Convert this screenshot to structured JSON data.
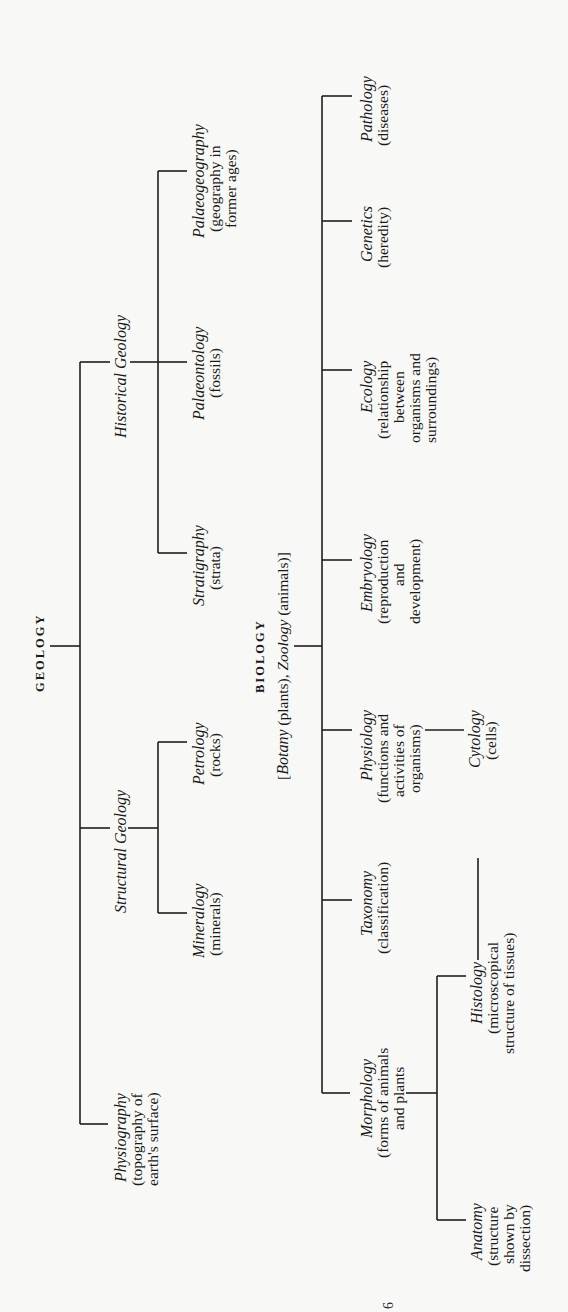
{
  "diagram": {
    "orientation": "rotated-90-ccw",
    "line_color": "#1e1e1e",
    "paper_color": "#f8f8f6",
    "geology": {
      "root": "GEOLOGY",
      "branches": [
        {
          "name": "Historical Geology",
          "children": [
            {
              "name": "Palaeogeography",
              "desc": [
                "(geography in",
                "former ages)"
              ]
            },
            {
              "name": "Palaeontology",
              "desc": [
                "(fossils)"
              ]
            },
            {
              "name": "Stratigraphy",
              "desc": [
                "(strata)"
              ]
            }
          ]
        },
        {
          "name": "Structural Geology",
          "children": [
            {
              "name": "Petrology",
              "desc": [
                "(rocks)"
              ]
            },
            {
              "name": "Mineralogy",
              "desc": [
                "(minerals)"
              ]
            }
          ]
        },
        {
          "name": "Physiography",
          "desc": [
            "(topography of",
            "earth's surface)"
          ]
        }
      ]
    },
    "biology": {
      "root": "BIOLOGY",
      "root_sub": {
        "bracket_open": "[",
        "botany": "Botany",
        "botany_desc": "(plants),",
        "zoology": "Zoology",
        "zoology_desc": "(animals)]"
      },
      "branches": [
        {
          "name": "Pathology",
          "desc": [
            "(diseases)"
          ]
        },
        {
          "name": "Genetics",
          "desc": [
            "(heredity)"
          ]
        },
        {
          "name": "Ecology",
          "desc": [
            "(relationship",
            "between",
            "organisms and",
            "surroundings)"
          ]
        },
        {
          "name": "Embryology",
          "desc": [
            "(reproduction",
            "and",
            "development)"
          ]
        },
        {
          "name": "Physiology",
          "desc": [
            "(functions and",
            "activities of",
            "organisms)"
          ]
        },
        {
          "name": "Taxonomy",
          "desc": [
            "(classification)"
          ]
        },
        {
          "name": "Morphology",
          "desc": [
            "(forms of animals",
            "and plants"
          ],
          "children": [
            {
              "name": "Histology",
              "desc": [
                "(microscopical",
                "structure of tissues)"
              ]
            },
            {
              "name": "Anatomy",
              "desc": [
                "(structure",
                "shown by",
                "dissection)"
              ]
            }
          ]
        }
      ],
      "linked": {
        "name": "Cytology",
        "desc": [
          "(cells)"
        ]
      }
    },
    "page_mark": "6"
  }
}
